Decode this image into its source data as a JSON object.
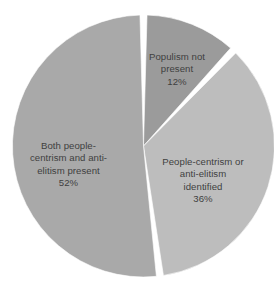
{
  "chart_data": {
    "type": "pie",
    "title": "",
    "subtitle": "",
    "xlabel": "",
    "ylabel": "",
    "legend_position": "none",
    "grid": false,
    "labels_inside_slices": true,
    "units": "percent",
    "total": 100,
    "categories": [
      "Populism not present",
      "People-centrism or anti-elitism identified",
      "Both people-centrism and anti-elitism present"
    ],
    "values": [
      12,
      36,
      52
    ],
    "slices": [
      {
        "name": "populism-not-present",
        "label": "Populism not\npresent",
        "value": 12,
        "percent_text": "12%",
        "color": "#9b9b9b",
        "start_angle_deg": 0,
        "end_angle_deg": 43.2
      },
      {
        "name": "one-identified",
        "label": "People-centrism or\nanti-elitism\nidentified",
        "value": 36,
        "percent_text": "36%",
        "color": "#bdbdbd",
        "start_angle_deg": 43.2,
        "end_angle_deg": 172.8
      },
      {
        "name": "both-present",
        "label": "Both people-\ncentrism and anti-\nelitism present",
        "value": 52,
        "percent_text": "52%",
        "color": "#a9a9a9",
        "start_angle_deg": 172.8,
        "end_angle_deg": 360
      }
    ]
  },
  "style": {
    "background": "#ffffff",
    "separator_color": "#ffffff",
    "text_color": "#3f3f3f"
  }
}
